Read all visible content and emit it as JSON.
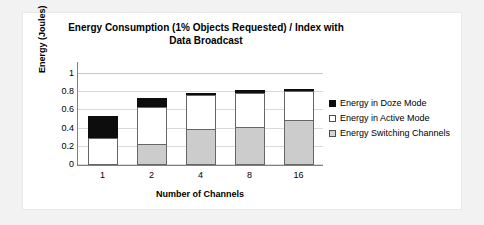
{
  "chart_data": {
    "type": "bar",
    "subtype": "stacked-bar",
    "title": "Energy Consumption (1% Objects Requested) / Index with Data Broadcast",
    "title_lines": [
      "Energy Consumption (1% Objects Requested) / Index with",
      "Data Broadcast"
    ],
    "xlabel": "Number of Channels",
    "ylabel": "Energy (Joules)",
    "categories": [
      "1",
      "2",
      "4",
      "8",
      "16"
    ],
    "ylim": [
      0,
      1
    ],
    "yticks": [
      0,
      0.2,
      0.4,
      0.6,
      0.8,
      1
    ],
    "ytick_labels": [
      "0",
      "0.2",
      "0.4",
      "0.6",
      "0.8",
      "1"
    ],
    "grid": "horizontal",
    "legend_position": "right",
    "stack_order_bottom_to_top": [
      "Energy Switching Channels",
      "Energy in Active Mode",
      "Energy in Doze Mode"
    ],
    "series": [
      {
        "name": "Energy Switching Channels",
        "color": "#cccccc",
        "values": [
          0,
          0.23,
          0.4,
          0.42,
          0.5
        ]
      },
      {
        "name": "Energy in Active Mode",
        "color": "#ffffff",
        "values": [
          0.3,
          0.41,
          0.38,
          0.38,
          0.32
        ]
      },
      {
        "name": "Energy in Doze Mode",
        "color": "#0d0d0d",
        "values": [
          0.25,
          0.1,
          0.025,
          0.03,
          0.025
        ]
      }
    ],
    "totals": [
      0.55,
      0.74,
      0.805,
      0.83,
      0.845
    ]
  },
  "legend": {
    "items": [
      {
        "label": "Energy in Doze Mode",
        "swatch": "black-filled-square"
      },
      {
        "label": "Energy in Active Mode",
        "swatch": "white-square"
      },
      {
        "label": "Energy Switching Channels",
        "swatch": "gray-square"
      }
    ]
  }
}
